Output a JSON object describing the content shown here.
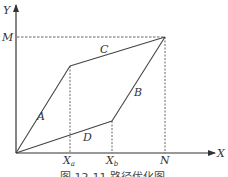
{
  "diagram": {
    "axes": {
      "x_label": "X",
      "y_label": "Y"
    },
    "y_markers": [
      {
        "label": "M"
      }
    ],
    "x_markers": [
      {
        "label": "X",
        "subscript": "a"
      },
      {
        "label": "X",
        "subscript": "b"
      },
      {
        "label": "N"
      }
    ],
    "paths": [
      {
        "label": "A",
        "from": "O",
        "to": "(Xa, upper)"
      },
      {
        "label": "C",
        "from": "(Xa, upper)",
        "to": "(N, M)"
      },
      {
        "label": "D",
        "from": "O",
        "to": "(Xb, lower)"
      },
      {
        "label": "B",
        "from": "(Xb, lower)",
        "to": "(N, M)"
      }
    ],
    "caption": "图 12-11  路径优化图"
  },
  "colors": {
    "line": "#444444",
    "dashed": "#555555",
    "background": "#ffffff"
  }
}
